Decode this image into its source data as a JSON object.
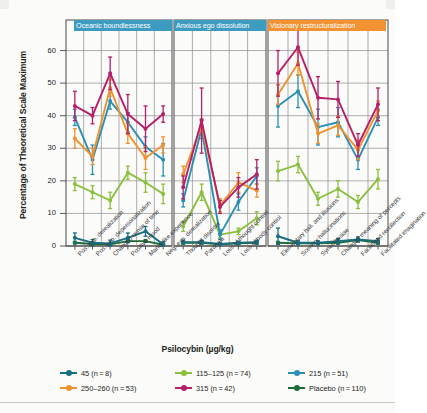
{
  "axes": {
    "ylabel": "Percentage of Theoretical Scale Maximum",
    "xlabel": "Psilocybin (µg/kg)",
    "yticks": [
      "0",
      "10",
      "20",
      "30",
      "40",
      "50",
      "60"
    ]
  },
  "panels": [
    {
      "name": "oceanic-boundlessness",
      "label": "Oceanic boundlessness",
      "color": "#3c9bbf"
    },
    {
      "name": "anxious-ego-dissolution",
      "label": "Anxious ego dissolution",
      "color": "#3c9bbf"
    },
    {
      "name": "visionary-restructuralization",
      "label": "Visionary restructuralization",
      "color": "#f29232"
    }
  ],
  "legend": [
    {
      "dose": "45",
      "n": "8",
      "text": "45 (n = 8)",
      "color": "#1a6e80"
    },
    {
      "dose": "250–260",
      "n": "53",
      "text": "250–260 (n = 53)",
      "color": "#f0912f"
    },
    {
      "dose": "115–125",
      "n": "74",
      "text": "115–125 (n = 74)",
      "color": "#8cbf3f"
    },
    {
      "dose": "315",
      "n": "42",
      "text": "315 (n = 42)",
      "color": "#b51f67"
    },
    {
      "dose": "215",
      "n": "51",
      "text": "215 (n = 51)",
      "color": "#2b8fb5"
    },
    {
      "dose": "Placebo",
      "n": "110",
      "text": "Placebo (n = 110)",
      "color": "#1d6b3a"
    }
  ],
  "chart_data": {
    "type": "line",
    "title": "",
    "xlabel": "Psilocybin (µg/kg)",
    "ylabel": "Percentage of Theoretical Scale Maximum",
    "ylim": [
      0,
      66
    ],
    "yticks": [
      0,
      10,
      20,
      30,
      40,
      50,
      60
    ],
    "grid": true,
    "legend_position": "bottom",
    "error_bars": "SEM",
    "panels": [
      {
        "label": "Oceanic boundlessness",
        "categories": [
          "Pos. exp. derealization",
          "Pos. exp. depersonalization",
          "Changed sense of time",
          "Positive mood",
          "Mania-like experience",
          "Neg. exp. derealization"
        ],
        "series": [
          {
            "name": "315",
            "values": [
              43.0,
              40.0,
              53.0,
              40.5,
              36.0,
              40.5
            ],
            "err": [
              4.5,
              2.5,
              5.0,
              6.0,
              7.0,
              2.5
            ]
          },
          {
            "name": "250–260",
            "values": [
              33.0,
              27.5,
              48.5,
              34.5,
              27.0,
              31.0
            ],
            "err": [
              3.0,
              2.5,
              2.5,
              3.0,
              3.5,
              2.5
            ]
          },
          {
            "name": "215",
            "values": [
              39.5,
              26.5,
              44.5,
              38.0,
              30.5,
              26.5
            ],
            "err": [
              2.5,
              4.5,
              2.5,
              3.0,
              3.0,
              5.0
            ]
          },
          {
            "name": "115–125",
            "values": [
              19.0,
              16.5,
              14.0,
              22.5,
              19.5,
              16.0
            ],
            "err": [
              2.0,
              2.0,
              2.5,
              2.0,
              3.0,
              3.0
            ]
          },
          {
            "name": "45",
            "values": [
              2.5,
              1.0,
              0.8,
              2.5,
              4.5,
              0.5
            ],
            "err": [
              1.5,
              1.0,
              1.0,
              1.5,
              1.5,
              0.8
            ]
          },
          {
            "name": "Placebo",
            "values": [
              1.0,
              0.6,
              0.5,
              1.5,
              1.5,
              0.4
            ],
            "err": [
              0.4,
              0.3,
              0.3,
              0.4,
              0.4,
              0.3
            ]
          }
        ]
      },
      {
        "label": "Anxious ego dissolution",
        "categories": [
          "Thought disorder",
          "Paranoia",
          "Loss of thought control",
          "Loss of body control"
        ],
        "series": [
          {
            "name": "315",
            "values": [
              18.0,
              38.5,
              12.0,
              18.0,
              22.0
            ],
            "err": [
              3.5,
              10.0,
              2.0,
              3.0,
              4.5
            ]
          },
          {
            "name": "250–260",
            "values": [
              22.0,
              37.0,
              12.5,
              19.5,
              17.0
            ],
            "err": [
              2.5,
              2.0,
              2.0,
              3.0,
              2.0
            ]
          },
          {
            "name": "215",
            "values": [
              14.0,
              36.0,
              3.5,
              13.5,
              21.5
            ],
            "err": [
              2.0,
              3.0,
              1.5,
              2.5,
              2.5
            ]
          },
          {
            "name": "115–125",
            "values": [
              6.0,
              16.5,
              3.5,
              4.5,
              8.5
            ],
            "err": [
              1.5,
              2.5,
              1.0,
              1.0,
              2.0
            ]
          },
          {
            "name": "45",
            "values": [
              1.2,
              1.2,
              0.6,
              1.0,
              1.2
            ],
            "err": [
              0.6,
              0.6,
              0.4,
              0.5,
              0.6
            ]
          },
          {
            "name": "Placebo",
            "values": [
              1.0,
              1.0,
              0.5,
              0.8,
              1.0
            ],
            "err": [
              0.4,
              0.4,
              0.3,
              0.4,
              0.4
            ]
          }
        ]
      },
      {
        "label": "Visionary restructuralization",
        "categories": [
          "Elementary hall. and illusions",
          "Scenery hallucinations",
          "Synesthesiae",
          "Changed meaning of percepts",
          "Facilitated recollection",
          "Facilitated imagination"
        ],
        "series": [
          {
            "name": "315",
            "values": [
              53.0,
              61.0,
              45.5,
              45.0,
              31.0,
              43.5
            ],
            "err": [
              7.0,
              5.5,
              6.5,
              5.5,
              3.5,
              5.0
            ]
          },
          {
            "name": "250–260",
            "values": [
              46.5,
              56.0,
              34.5,
              37.0,
              29.5,
              41.5
            ],
            "err": [
              3.0,
              3.5,
              3.0,
              3.0,
              3.0,
              3.0
            ]
          },
          {
            "name": "215",
            "values": [
              43.0,
              47.5,
              36.5,
              38.0,
              26.5,
              39.5
            ],
            "err": [
              6.5,
              5.0,
              5.5,
              4.5,
              3.0,
              2.5
            ]
          },
          {
            "name": "115–125",
            "values": [
              23.0,
              25.0,
              14.5,
              17.5,
              13.5,
              20.5
            ],
            "err": [
              3.0,
              2.5,
              2.0,
              2.5,
              2.0,
              3.0
            ]
          },
          {
            "name": "45",
            "values": [
              3.0,
              1.0,
              1.0,
              1.5,
              2.0,
              1.5
            ],
            "err": [
              2.5,
              0.6,
              0.6,
              0.8,
              0.8,
              0.8
            ]
          },
          {
            "name": "Placebo",
            "values": [
              1.0,
              0.8,
              0.8,
              1.0,
              1.8,
              1.0
            ],
            "err": [
              0.4,
              0.3,
              0.3,
              0.4,
              0.5,
              0.4
            ]
          }
        ]
      }
    ]
  }
}
